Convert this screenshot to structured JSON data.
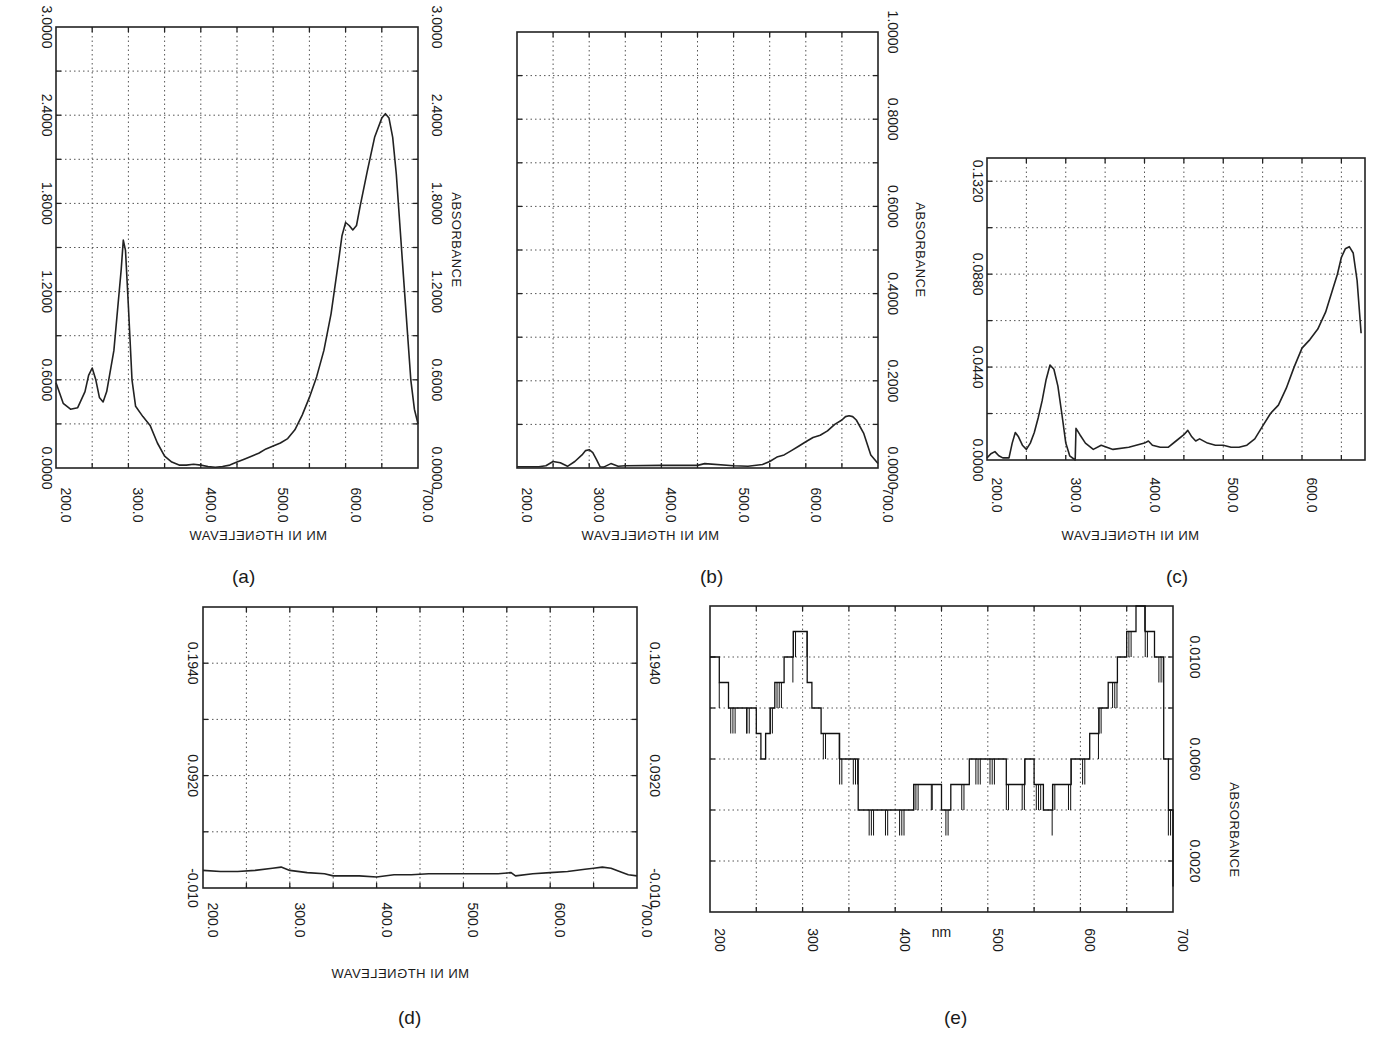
{
  "figure": {
    "labels": [
      "(a)",
      "(b)",
      "(c)",
      "(d)",
      "(e)"
    ]
  },
  "chart_data": [
    {
      "id": "a",
      "type": "line",
      "title": "",
      "panel_label": "(a)",
      "xlabel": "WAVELENGTH IN NM",
      "ylabel": "ABSORBANCE",
      "xlim": [
        200,
        700
      ],
      "ylim": [
        0.0,
        3.0
      ],
      "xticks": [
        "200.0",
        "300.0",
        "400.0",
        "500.0",
        "600.0",
        "700.0"
      ],
      "yticks": [
        "0.0000",
        "0.6000",
        "1.2000",
        "1.8000",
        "2.4000",
        "3.0000"
      ],
      "grid": true,
      "orientation": "rotated-90",
      "x": [
        200,
        210,
        220,
        230,
        240,
        245,
        250,
        255,
        260,
        265,
        270,
        280,
        290,
        293,
        296,
        300,
        305,
        310,
        320,
        330,
        340,
        350,
        360,
        370,
        380,
        390,
        400,
        410,
        420,
        430,
        440,
        450,
        460,
        470,
        480,
        490,
        500,
        510,
        520,
        530,
        540,
        550,
        560,
        570,
        580,
        590,
        595,
        600,
        605,
        610,
        615,
        620,
        630,
        640,
        650,
        655,
        660,
        665,
        670,
        680,
        690,
        695,
        700
      ],
      "values": [
        0.58,
        0.44,
        0.4,
        0.41,
        0.52,
        0.63,
        0.68,
        0.6,
        0.48,
        0.45,
        0.52,
        0.8,
        1.35,
        1.55,
        1.48,
        1.1,
        0.6,
        0.42,
        0.35,
        0.29,
        0.17,
        0.08,
        0.04,
        0.02,
        0.02,
        0.025,
        0.02,
        0.01,
        0.005,
        0.01,
        0.02,
        0.04,
        0.06,
        0.08,
        0.1,
        0.13,
        0.15,
        0.17,
        0.2,
        0.26,
        0.36,
        0.48,
        0.62,
        0.8,
        1.05,
        1.4,
        1.58,
        1.67,
        1.65,
        1.62,
        1.65,
        1.78,
        2.02,
        2.25,
        2.38,
        2.41,
        2.38,
        2.25,
        2.0,
        1.3,
        0.6,
        0.4,
        0.3
      ]
    },
    {
      "id": "b",
      "type": "line",
      "title": "",
      "panel_label": "(b)",
      "xlabel": "WAVELENGTH IN NM",
      "ylabel": "ABSORBANCE",
      "xlim": [
        200,
        700
      ],
      "ylim": [
        0.0,
        1.0
      ],
      "xticks": [
        "200.0",
        "300.0",
        "400.0",
        "500.0",
        "600.0",
        "700.0"
      ],
      "yticks": [
        "0.0000",
        "0.2000",
        "0.4000",
        "0.6000",
        "0.8000",
        "1.0000"
      ],
      "grid": true,
      "orientation": "rotated-90",
      "x": [
        200,
        230,
        240,
        250,
        260,
        270,
        280,
        290,
        295,
        300,
        305,
        310,
        315,
        320,
        330,
        340,
        350,
        400,
        450,
        460,
        500,
        520,
        540,
        550,
        560,
        570,
        580,
        590,
        600,
        610,
        620,
        630,
        640,
        650,
        655,
        660,
        665,
        670,
        680,
        690,
        700
      ],
      "values": [
        0.003,
        0.003,
        0.005,
        0.015,
        0.012,
        0.004,
        0.015,
        0.03,
        0.04,
        0.042,
        0.035,
        0.02,
        0.003,
        0.002,
        0.01,
        0.004,
        0.005,
        0.006,
        0.006,
        0.01,
        0.005,
        0.004,
        0.008,
        0.015,
        0.025,
        0.03,
        0.04,
        0.05,
        0.06,
        0.07,
        0.075,
        0.085,
        0.1,
        0.11,
        0.118,
        0.12,
        0.118,
        0.11,
        0.08,
        0.03,
        0.01
      ]
    },
    {
      "id": "c",
      "type": "line",
      "title": "",
      "panel_label": "(c)",
      "xlabel": "WAVELENGTH IN NM",
      "ylabel": "",
      "xlim": [
        200,
        680
      ],
      "ylim": [
        0.0,
        0.143
      ],
      "xticks": [
        "200.0",
        "300.0",
        "400.0",
        "500.0",
        "600.0"
      ],
      "yticks": [
        "0.0000",
        "0.0440",
        "0.0880",
        "0.1320"
      ],
      "ytick_values": [
        0.0,
        0.044,
        0.088,
        0.132
      ],
      "grid": true,
      "orientation": "rotated-90",
      "x": [
        200,
        205,
        210,
        215,
        220,
        228,
        232,
        236,
        240,
        245,
        250,
        255,
        260,
        265,
        270,
        275,
        280,
        285,
        290,
        295,
        300,
        305,
        312,
        313,
        318,
        325,
        335,
        345,
        360,
        380,
        400,
        405,
        410,
        420,
        430,
        440,
        450,
        455,
        460,
        465,
        470,
        480,
        490,
        500,
        510,
        520,
        530,
        540,
        550,
        560,
        570,
        580,
        590,
        600,
        610,
        620,
        630,
        640,
        645,
        650,
        655,
        660,
        665,
        670,
        675
      ],
      "values": [
        0.001,
        0.003,
        0.004,
        0.002,
        0.001,
        0.001,
        0.008,
        0.013,
        0.011,
        0.007,
        0.005,
        0.008,
        0.013,
        0.02,
        0.028,
        0.038,
        0.045,
        0.043,
        0.035,
        0.022,
        0.008,
        0.002,
        0.0,
        0.015,
        0.012,
        0.008,
        0.005,
        0.007,
        0.005,
        0.006,
        0.008,
        0.009,
        0.007,
        0.006,
        0.006,
        0.009,
        0.012,
        0.014,
        0.011,
        0.009,
        0.01,
        0.008,
        0.007,
        0.007,
        0.006,
        0.006,
        0.007,
        0.01,
        0.016,
        0.022,
        0.026,
        0.034,
        0.044,
        0.053,
        0.057,
        0.062,
        0.07,
        0.082,
        0.088,
        0.096,
        0.1,
        0.101,
        0.098,
        0.085,
        0.06
      ]
    },
    {
      "id": "d",
      "type": "line",
      "title": "",
      "panel_label": "(d)",
      "xlabel": "WAVELENGTH IN NM",
      "ylabel": "",
      "xlim": [
        200,
        700
      ],
      "ylim": [
        -0.01,
        0.245
      ],
      "xticks": [
        "200.0",
        "300.0",
        "400.0",
        "500.0",
        "600.0",
        "700.0"
      ],
      "yticks": [
        "-0.010",
        "0.0920",
        "0.1940"
      ],
      "ytick_values": [
        -0.01,
        0.092,
        0.194
      ],
      "grid": true,
      "orientation": "rotated-90",
      "x": [
        200,
        220,
        240,
        260,
        280,
        290,
        300,
        320,
        340,
        350,
        360,
        380,
        400,
        420,
        440,
        460,
        480,
        500,
        520,
        540,
        555,
        560,
        580,
        600,
        620,
        640,
        650,
        660,
        670,
        680,
        690,
        700
      ],
      "values": [
        0.006,
        0.005,
        0.005,
        0.006,
        0.008,
        0.009,
        0.006,
        0.004,
        0.003,
        0.001,
        0.001,
        0.001,
        0.0,
        0.002,
        0.002,
        0.003,
        0.003,
        0.003,
        0.003,
        0.003,
        0.004,
        0.001,
        0.003,
        0.004,
        0.005,
        0.007,
        0.008,
        0.009,
        0.008,
        0.005,
        0.002,
        0.001
      ]
    },
    {
      "id": "e",
      "type": "line",
      "title": "",
      "panel_label": "(e)",
      "xlabel": "nm",
      "ylabel": "ABSORBANCE",
      "xlim": [
        200,
        700
      ],
      "ylim": [
        0.0,
        0.012
      ],
      "xticks": [
        "200",
        "300",
        "400",
        "500",
        "600",
        "700"
      ],
      "yticks": [
        "0.0020",
        "0.0060",
        "0.0100"
      ],
      "ytick_values": [
        0.002,
        0.006,
        0.01
      ],
      "grid": true,
      "step": true,
      "orientation": "rotated-90",
      "x": [
        200,
        205,
        210,
        220,
        230,
        240,
        250,
        255,
        260,
        265,
        270,
        280,
        290,
        300,
        305,
        310,
        320,
        330,
        340,
        350,
        360,
        380,
        400,
        410,
        420,
        440,
        450,
        460,
        480,
        500,
        520,
        530,
        540,
        550,
        560,
        570,
        580,
        590,
        600,
        610,
        620,
        630,
        640,
        650,
        660,
        670,
        680,
        690,
        695,
        700
      ],
      "values": [
        0.01,
        0.01,
        0.009,
        0.008,
        0.008,
        0.008,
        0.007,
        0.006,
        0.007,
        0.008,
        0.009,
        0.01,
        0.011,
        0.011,
        0.009,
        0.008,
        0.007,
        0.007,
        0.006,
        0.006,
        0.004,
        0.004,
        0.004,
        0.004,
        0.005,
        0.005,
        0.004,
        0.005,
        0.006,
        0.006,
        0.005,
        0.005,
        0.006,
        0.005,
        0.004,
        0.005,
        0.005,
        0.006,
        0.006,
        0.007,
        0.008,
        0.009,
        0.01,
        0.011,
        0.012,
        0.011,
        0.01,
        0.006,
        0.004,
        0.001
      ]
    }
  ]
}
